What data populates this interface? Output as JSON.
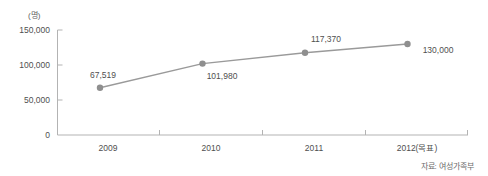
{
  "chart_data": {
    "type": "line",
    "title": "",
    "subtitle": "",
    "xlabel": "",
    "ylabel": "",
    "unit_label": "(명)",
    "categories": [
      "2009",
      "2010",
      "2011",
      "2012(목표)"
    ],
    "values": [
      67519,
      101980,
      117370,
      130000
    ],
    "point_labels": [
      "67,519",
      "101,980",
      "117,370",
      "130,000"
    ],
    "ylim": [
      0,
      150000
    ],
    "ytick_labels": [
      "0",
      "50,000",
      "100,000",
      "150,000"
    ],
    "ytick_values": [
      0,
      50000,
      100000,
      150000
    ],
    "grid": false,
    "legend": "none",
    "series": [
      {
        "name": "",
        "values": [
          67519,
          101980,
          117370,
          130000
        ]
      }
    ],
    "line_color": "#9a9a9a",
    "marker_color": "#8f8f8f",
    "axis_color": "#b3b3b3",
    "text_color": "#4f4f4f",
    "source_note": "자료: 여성가족부"
  }
}
